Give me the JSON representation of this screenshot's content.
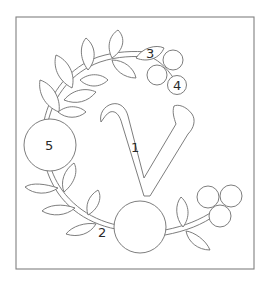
{
  "figure": {
    "title": "",
    "colors": {
      "line": "#6e6e6e",
      "label": "#2a2a2a",
      "border": "#808080",
      "background": "#ffffff"
    }
  },
  "labels": {
    "piece_1": "1",
    "piece_2": "2",
    "piece_3": "3",
    "piece_4": "4",
    "piece_5": "5"
  },
  "letter": {
    "glyph": "v"
  }
}
